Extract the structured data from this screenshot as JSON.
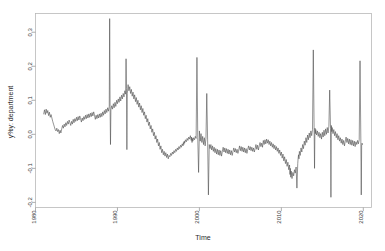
{
  "chart_data": {
    "type": "line",
    "title": "",
    "xlabel": "Time",
    "ylabel": "y%y: department",
    "xlim": [
      1980,
      2021
    ],
    "ylim": [
      -0.215,
      0.355
    ],
    "grid": false,
    "legend": "none",
    "xticks": [
      1980,
      1990,
      2000,
      2010,
      2020
    ],
    "xticklabels": [
      "1980",
      "1990",
      "2000",
      "2010",
      "2020"
    ],
    "yticks": [
      -0.2,
      -0.1,
      0.0,
      0.1,
      0.2,
      0.3
    ],
    "yticklabels": [
      "-0.2",
      "-0.1",
      "0.0",
      "0.1",
      "0.2",
      "0.3"
    ],
    "series_name": "y%y: department",
    "line_color": "#4d4d4d",
    "x": [
      1981.0,
      1981.1,
      1981.2,
      1981.3,
      1981.4,
      1981.5,
      1981.6,
      1981.7,
      1981.8,
      1981.9,
      1982.0,
      1982.1,
      1982.2,
      1982.3,
      1982.4,
      1982.5,
      1982.6,
      1982.7,
      1982.8,
      1982.9,
      1983.0,
      1983.1,
      1983.2,
      1983.3,
      1983.4,
      1983.5,
      1983.6,
      1983.7,
      1983.8,
      1983.9,
      1984.0,
      1984.1,
      1984.2,
      1984.3,
      1984.4,
      1984.5,
      1984.6,
      1984.7,
      1984.8,
      1984.9,
      1985.0,
      1985.1,
      1985.2,
      1985.3,
      1985.4,
      1985.5,
      1985.6,
      1985.7,
      1985.8,
      1985.9,
      1986.0,
      1986.1,
      1986.2,
      1986.3,
      1986.4,
      1986.5,
      1986.6,
      1986.7,
      1986.8,
      1986.9,
      1987.0,
      1987.1,
      1987.2,
      1987.3,
      1987.4,
      1987.5,
      1987.6,
      1987.7,
      1987.8,
      1987.9,
      1988.0,
      1988.1,
      1988.2,
      1988.3,
      1988.4,
      1988.5,
      1988.6,
      1988.7,
      1988.8,
      1988.9,
      1989.0,
      1989.05,
      1989.1,
      1989.15,
      1989.2,
      1989.3,
      1989.4,
      1989.5,
      1989.6,
      1989.7,
      1989.8,
      1989.9,
      1990.0,
      1990.1,
      1990.2,
      1990.3,
      1990.4,
      1990.5,
      1990.6,
      1990.7,
      1990.8,
      1990.9,
      1991.0,
      1991.05,
      1991.1,
      1991.15,
      1991.2,
      1991.3,
      1991.4,
      1991.5,
      1991.6,
      1991.7,
      1991.8,
      1991.9,
      1992.0,
      1992.1,
      1992.2,
      1992.3,
      1992.4,
      1992.5,
      1992.6,
      1992.7,
      1992.8,
      1992.9,
      1993.0,
      1993.1,
      1993.2,
      1993.3,
      1993.4,
      1993.5,
      1993.6,
      1993.7,
      1993.8,
      1993.9,
      1994.0,
      1994.1,
      1994.2,
      1994.3,
      1994.4,
      1994.5,
      1994.6,
      1994.7,
      1994.8,
      1994.9,
      1995.0,
      1995.1,
      1995.2,
      1995.3,
      1995.4,
      1995.5,
      1995.6,
      1995.7,
      1995.8,
      1995.9,
      1996.0,
      1996.1,
      1996.2,
      1996.3,
      1996.4,
      1996.5,
      1996.6,
      1996.7,
      1996.8,
      1996.9,
      1997.0,
      1997.1,
      1997.2,
      1997.3,
      1997.4,
      1997.5,
      1997.6,
      1997.7,
      1997.8,
      1997.9,
      1998.0,
      1998.05,
      1998.1,
      1998.15,
      1998.2,
      1998.3,
      1998.4,
      1998.5,
      1998.6,
      1998.7,
      1998.8,
      1998.9,
      1999.0,
      1999.05,
      1999.1,
      1999.15,
      1999.2,
      1999.3,
      1999.4,
      1999.5,
      1999.6,
      1999.7,
      1999.8,
      1999.9,
      2000.0,
      2000.1,
      2000.2,
      2000.3,
      2000.4,
      2000.5,
      2000.6,
      2000.7,
      2000.8,
      2000.9,
      2001.0,
      2001.1,
      2001.2,
      2001.3,
      2001.4,
      2001.5,
      2001.6,
      2001.7,
      2001.8,
      2001.9,
      2002.0,
      2002.1,
      2002.2,
      2002.3,
      2002.4,
      2002.5,
      2002.6,
      2002.7,
      2002.8,
      2002.9,
      2003.0,
      2003.1,
      2003.2,
      2003.3,
      2003.4,
      2003.5,
      2003.6,
      2003.7,
      2003.8,
      2003.9,
      2004.0,
      2004.1,
      2004.2,
      2004.3,
      2004.4,
      2004.5,
      2004.6,
      2004.7,
      2004.8,
      2004.9,
      2005.0,
      2005.1,
      2005.2,
      2005.3,
      2005.4,
      2005.5,
      2005.6,
      2005.7,
      2005.8,
      2005.9,
      2006.0,
      2006.1,
      2006.2,
      2006.3,
      2006.4,
      2006.5,
      2006.6,
      2006.7,
      2006.8,
      2006.9,
      2007.0,
      2007.1,
      2007.2,
      2007.3,
      2007.4,
      2007.5,
      2007.6,
      2007.7,
      2007.8,
      2007.9,
      2008.0,
      2008.1,
      2008.2,
      2008.3,
      2008.4,
      2008.5,
      2008.6,
      2008.7,
      2008.8,
      2008.9,
      2009.0,
      2009.1,
      2009.2,
      2009.3,
      2009.4,
      2009.5,
      2009.6,
      2009.7,
      2009.8,
      2009.9,
      2010.0,
      2010.1,
      2010.2,
      2010.3,
      2010.4,
      2010.5,
      2010.6,
      2010.7,
      2010.8,
      2010.9,
      2011.0,
      2011.05,
      2011.1,
      2011.15,
      2011.2,
      2011.3,
      2011.4,
      2011.5,
      2011.6,
      2011.7,
      2011.8,
      2011.9,
      2012.0,
      2012.05,
      2012.1,
      2012.15,
      2012.2,
      2012.3,
      2012.4,
      2012.5,
      2012.6,
      2012.7,
      2012.8,
      2012.9,
      2013.0,
      2013.1,
      2013.2,
      2013.3,
      2013.4,
      2013.5,
      2013.6,
      2013.7,
      2013.8,
      2013.9,
      2014.0,
      2014.05,
      2014.1,
      2014.15,
      2014.2,
      2014.3,
      2014.4,
      2014.5,
      2014.6,
      2014.7,
      2014.8,
      2014.9,
      2015.0,
      2015.1,
      2015.2,
      2015.3,
      2015.4,
      2015.5,
      2015.6,
      2015.7,
      2015.8,
      2015.9,
      2016.0,
      2016.05,
      2016.1,
      2016.15,
      2016.2,
      2016.3,
      2016.4,
      2016.5,
      2016.6,
      2016.7,
      2016.8,
      2016.9,
      2017.0,
      2017.1,
      2017.2,
      2017.3,
      2017.4,
      2017.5,
      2017.6,
      2017.7,
      2017.8,
      2017.9,
      2018.0,
      2018.1,
      2018.2,
      2018.3,
      2018.4,
      2018.5,
      2018.6,
      2018.7,
      2018.8,
      2018.9,
      2019.0,
      2019.1,
      2019.2,
      2019.3,
      2019.4,
      2019.5,
      2019.6,
      2019.7,
      2019.75,
      2019.8,
      2019.85,
      2019.9,
      2020.0,
      2020.1
    ],
    "y": [
      0.06,
      0.072,
      0.058,
      0.074,
      0.062,
      0.07,
      0.055,
      0.065,
      0.05,
      0.058,
      0.048,
      0.038,
      0.03,
      0.022,
      0.014,
      0.01,
      0.018,
      0.008,
      0.014,
      0.002,
      0.012,
      0.004,
      0.016,
      0.026,
      0.018,
      0.03,
      0.022,
      0.034,
      0.026,
      0.038,
      0.03,
      0.042,
      0.034,
      0.026,
      0.038,
      0.03,
      0.044,
      0.034,
      0.046,
      0.038,
      0.05,
      0.04,
      0.052,
      0.042,
      0.054,
      0.046,
      0.036,
      0.048,
      0.04,
      0.052,
      0.044,
      0.056,
      0.046,
      0.058,
      0.048,
      0.06,
      0.05,
      0.062,
      0.052,
      0.064,
      0.054,
      0.066,
      0.056,
      0.044,
      0.056,
      0.046,
      0.058,
      0.048,
      0.06,
      0.05,
      0.062,
      0.052,
      0.066,
      0.056,
      0.07,
      0.06,
      0.074,
      0.064,
      0.078,
      0.068,
      0.082,
      0.34,
      0.082,
      -0.03,
      0.072,
      0.084,
      0.074,
      0.09,
      0.078,
      0.094,
      0.082,
      0.1,
      0.09,
      0.104,
      0.094,
      0.11,
      0.098,
      0.115,
      0.104,
      0.12,
      0.11,
      0.128,
      0.118,
      0.222,
      0.135,
      -0.045,
      0.12,
      0.146,
      0.128,
      0.14,
      0.12,
      0.132,
      0.112,
      0.124,
      0.104,
      0.116,
      0.096,
      0.108,
      0.088,
      0.1,
      0.08,
      0.092,
      0.072,
      0.084,
      0.064,
      0.076,
      0.056,
      0.066,
      0.046,
      0.056,
      0.036,
      0.046,
      0.026,
      0.036,
      0.016,
      0.026,
      0.006,
      0.016,
      -0.004,
      0.006,
      -0.014,
      -0.004,
      -0.024,
      -0.014,
      -0.034,
      -0.024,
      -0.044,
      -0.034,
      -0.054,
      -0.044,
      -0.06,
      -0.05,
      -0.064,
      -0.054,
      -0.068,
      -0.058,
      -0.072,
      -0.062,
      -0.066,
      -0.056,
      -0.062,
      -0.052,
      -0.058,
      -0.048,
      -0.054,
      -0.044,
      -0.05,
      -0.04,
      -0.046,
      -0.036,
      -0.042,
      -0.032,
      -0.038,
      -0.028,
      -0.034,
      -0.024,
      -0.03,
      -0.02,
      -0.026,
      -0.016,
      -0.022,
      -0.012,
      -0.018,
      -0.008,
      -0.014,
      -0.004,
      -0.018,
      -0.008,
      -0.024,
      -0.012,
      -0.02,
      -0.01,
      -0.016,
      -0.006,
      -0.012,
      0.226,
      -0.01,
      -0.112,
      0.01,
      -0.02,
      0.002,
      -0.024,
      -0.006,
      -0.03,
      -0.01,
      -0.034,
      -0.012,
      0.12,
      -0.014,
      -0.178,
      -0.03,
      -0.042,
      -0.03,
      -0.046,
      -0.034,
      -0.05,
      -0.038,
      -0.054,
      -0.042,
      -0.058,
      -0.044,
      -0.06,
      -0.046,
      -0.062,
      -0.048,
      -0.064,
      -0.05,
      -0.038,
      -0.052,
      -0.04,
      -0.054,
      -0.042,
      -0.056,
      -0.044,
      -0.058,
      -0.046,
      -0.06,
      -0.048,
      -0.062,
      -0.05,
      -0.04,
      -0.052,
      -0.042,
      -0.054,
      -0.044,
      -0.056,
      -0.046,
      -0.034,
      -0.048,
      -0.036,
      -0.05,
      -0.038,
      -0.052,
      -0.04,
      -0.054,
      -0.042,
      -0.056,
      -0.044,
      -0.034,
      -0.046,
      -0.036,
      -0.048,
      -0.038,
      -0.05,
      -0.04,
      -0.052,
      -0.042,
      -0.03,
      -0.044,
      -0.032,
      -0.046,
      -0.034,
      -0.024,
      -0.036,
      -0.026,
      -0.038,
      -0.018,
      -0.03,
      -0.016,
      -0.028,
      -0.014,
      -0.026,
      -0.016,
      -0.03,
      -0.02,
      -0.034,
      -0.024,
      -0.038,
      -0.028,
      -0.042,
      -0.032,
      -0.046,
      -0.036,
      -0.05,
      -0.04,
      -0.056,
      -0.046,
      -0.062,
      -0.052,
      -0.07,
      -0.058,
      -0.078,
      -0.066,
      -0.086,
      -0.074,
      -0.094,
      -0.082,
      -0.104,
      -0.09,
      -0.118,
      -0.1,
      -0.126,
      -0.108,
      -0.13,
      -0.112,
      -0.122,
      -0.104,
      -0.114,
      -0.096,
      -0.158,
      -0.086,
      -0.07,
      -0.06,
      -0.072,
      -0.05,
      -0.062,
      -0.04,
      -0.052,
      -0.03,
      -0.042,
      -0.02,
      -0.032,
      -0.01,
      -0.024,
      -0.002,
      -0.016,
      0.004,
      -0.01,
      0.01,
      -0.004,
      0.014,
      0.248,
      0.012,
      -0.1,
      0.018,
      0.002,
      0.014,
      -0.002,
      0.01,
      -0.006,
      0.006,
      -0.01,
      0.002,
      -0.014,
      0.006,
      -0.008,
      0.012,
      -0.004,
      0.016,
      0.0,
      0.02,
      0.004,
      0.024,
      0.13,
      0.018,
      -0.185,
      0.026,
      0.008,
      0.02,
      0.002,
      0.014,
      -0.004,
      0.008,
      -0.01,
      0.002,
      -0.016,
      -0.004,
      -0.02,
      -0.01,
      -0.026,
      -0.014,
      -0.03,
      -0.018,
      -0.034,
      -0.02,
      -0.008,
      -0.024,
      -0.012,
      -0.028,
      -0.014,
      -0.03,
      -0.016,
      -0.032,
      -0.018,
      -0.034,
      -0.02,
      -0.036,
      -0.022,
      -0.03,
      -0.018,
      -0.028,
      -0.016,
      0.216,
      -0.02,
      -0.178,
      -0.03,
      -0.026,
      -0.03
    ]
  },
  "caption": {
    "watermark": ""
  }
}
